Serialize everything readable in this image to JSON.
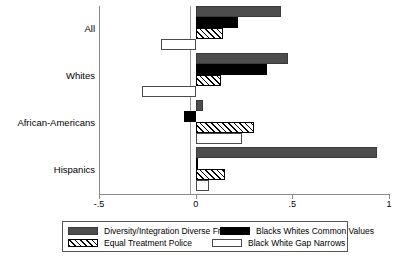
{
  "chart_data": {
    "type": "bar",
    "orientation": "horizontal",
    "title": "",
    "xlabel": "",
    "ylabel": "",
    "categories": [
      "All",
      "Whites",
      "African-Americans",
      "Hispanics"
    ],
    "xlim": [
      -0.5,
      1.0
    ],
    "xticks": [
      -0.5,
      0,
      0.5,
      1
    ],
    "xtick_labels": [
      "-.5",
      "0",
      ".5",
      "1"
    ],
    "grid": false,
    "zero_reference_line": true,
    "legend_position": "bottom",
    "series": [
      {
        "name": "Diversity/Integration Diverse Friends",
        "style": "solid-gray",
        "color": "#4d4d4d",
        "values": [
          0.44,
          0.48,
          0.04,
          0.94
        ]
      },
      {
        "name": "Blacks Whites Common Values",
        "style": "solid-black",
        "color": "#000000",
        "values": [
          0.22,
          0.37,
          -0.06,
          0.01
        ]
      },
      {
        "name": "Equal Treatment Police",
        "style": "hatched",
        "color": "#ffffff",
        "values": [
          0.14,
          0.13,
          0.3,
          0.15
        ]
      },
      {
        "name": "Black White Gap Narrows",
        "style": "hollow-white",
        "color": "#ffffff",
        "values": [
          -0.18,
          -0.28,
          0.24,
          0.07
        ]
      }
    ]
  },
  "legend": {
    "entries": [
      {
        "label": "Diversity/Integration Diverse Friends"
      },
      {
        "label": "Blacks Whites Common Values"
      },
      {
        "label": "Equal Treatment Police"
      },
      {
        "label": "Black White Gap Narrows"
      }
    ]
  }
}
